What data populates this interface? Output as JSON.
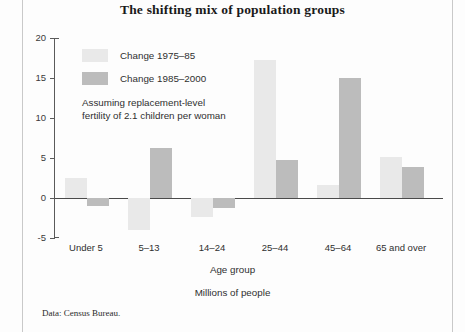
{
  "chart_data": {
    "type": "bar",
    "title": "The shifting mix of population groups",
    "subtitle": "Millions of people",
    "xlabel": "Age group",
    "ylabel": "",
    "ylim": [
      -5,
      20
    ],
    "yticks": [
      20,
      15,
      10,
      5,
      0,
      -5
    ],
    "grid": false,
    "legend_position": "upper-left-inside",
    "annotation": "Assuming replacement-level fertility of 2.1 children per woman",
    "annotation_lines": [
      "Assuming replacement-level",
      "fertility of 2.1 children per woman"
    ],
    "source": "Data: Census Bureau.",
    "categories": [
      "Under 5",
      "5–13",
      "14–24",
      "25–44",
      "45–64",
      "65 and over"
    ],
    "series": [
      {
        "name": "Change 1975–85",
        "color": "#e9e9e9",
        "values": [
          2.5,
          -4.0,
          -2.4,
          17.2,
          1.6,
          5.1
        ]
      },
      {
        "name": "Change 1985–2000",
        "color": "#bcbcbc",
        "values": [
          -1.0,
          6.3,
          -1.2,
          4.8,
          15.0,
          3.9
        ]
      }
    ]
  },
  "colors": {
    "series_light": "#e9e9e9",
    "series_dark": "#bcbcbc",
    "axis": "#5a5a5a",
    "text": "#2f2f2f"
  }
}
